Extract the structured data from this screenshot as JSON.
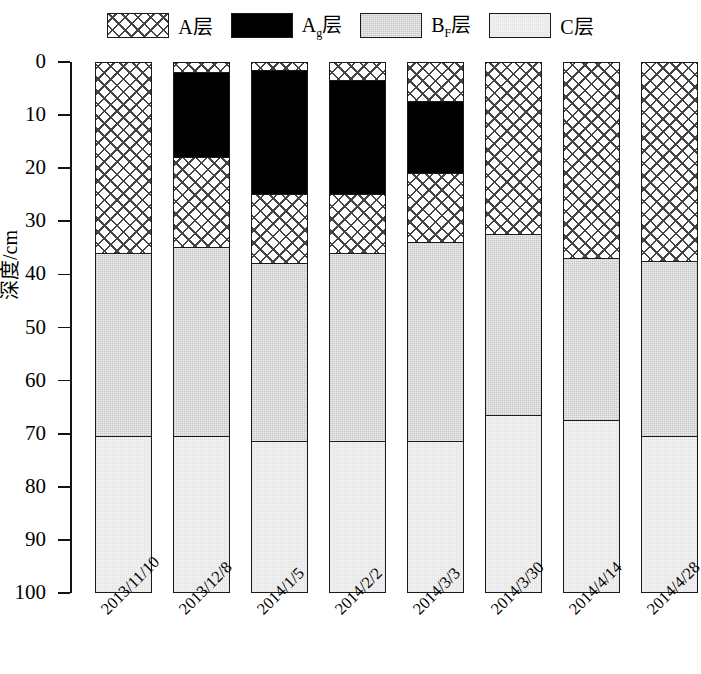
{
  "chart_data": {
    "type": "bar",
    "subtype": "stacked-vertical-soil-profile",
    "title": "",
    "xlabel": "",
    "ylabel": "深度/cm",
    "ylim": [
      0,
      100
    ],
    "y_inverted": true,
    "yticks": [
      0,
      10,
      20,
      30,
      40,
      50,
      60,
      70,
      80,
      90,
      100
    ],
    "ytick_labels": [
      "0",
      "10",
      "20",
      "30",
      "40",
      "50",
      "60",
      "70",
      "80",
      "90",
      "100"
    ],
    "grid": false,
    "legend_position": "top-center",
    "categories": [
      "2013/11/10",
      "2013/12/8",
      "2014/1/5",
      "2014/2/2",
      "2014/3/3",
      "2014/3/30",
      "2014/4/14",
      "2014/4/28"
    ],
    "legend": [
      {
        "key": "A",
        "label": "A层",
        "label_main": "A",
        "label_sub": "",
        "label_tail": "层",
        "fill": "crosshatch",
        "color": "#ffffff"
      },
      {
        "key": "Ag",
        "label": "Ag层",
        "label_main": "A",
        "label_sub": "g",
        "label_tail": "层",
        "fill": "solid",
        "color": "#000000"
      },
      {
        "key": "BF",
        "label": "BF层",
        "label_main": "B",
        "label_sub": "F",
        "label_tail": "层",
        "fill": "stipple",
        "color": "#cfcfcf"
      },
      {
        "key": "C",
        "label": "C层",
        "label_main": "C",
        "label_sub": "",
        "label_tail": "层",
        "fill": "light",
        "color": "#f4f4f4"
      }
    ],
    "columns": [
      {
        "date": "2013/11/10",
        "segments": [
          {
            "layer": "A",
            "top": 0,
            "bottom": 36.0
          },
          {
            "layer": "BF",
            "top": 36.0,
            "bottom": 70.5
          },
          {
            "layer": "C",
            "top": 70.5,
            "bottom": 100
          }
        ]
      },
      {
        "date": "2013/12/8",
        "segments": [
          {
            "layer": "A",
            "top": 0,
            "bottom": 2.0
          },
          {
            "layer": "Ag",
            "top": 2.0,
            "bottom": 18.0
          },
          {
            "layer": "A",
            "top": 18.0,
            "bottom": 35.0
          },
          {
            "layer": "BF",
            "top": 35.0,
            "bottom": 70.5
          },
          {
            "layer": "C",
            "top": 70.5,
            "bottom": 100
          }
        ]
      },
      {
        "date": "2014/1/5",
        "segments": [
          {
            "layer": "A",
            "top": 0,
            "bottom": 1.5
          },
          {
            "layer": "Ag",
            "top": 1.5,
            "bottom": 25.0
          },
          {
            "layer": "A",
            "top": 25.0,
            "bottom": 38.0
          },
          {
            "layer": "BF",
            "top": 38.0,
            "bottom": 71.5
          },
          {
            "layer": "C",
            "top": 71.5,
            "bottom": 100
          }
        ]
      },
      {
        "date": "2014/2/2",
        "segments": [
          {
            "layer": "A",
            "top": 0,
            "bottom": 3.5
          },
          {
            "layer": "Ag",
            "top": 3.5,
            "bottom": 25.0
          },
          {
            "layer": "A",
            "top": 25.0,
            "bottom": 36.0
          },
          {
            "layer": "BF",
            "top": 36.0,
            "bottom": 71.5
          },
          {
            "layer": "C",
            "top": 71.5,
            "bottom": 100
          }
        ]
      },
      {
        "date": "2014/3/3",
        "segments": [
          {
            "layer": "A",
            "top": 0,
            "bottom": 7.5
          },
          {
            "layer": "Ag",
            "top": 7.5,
            "bottom": 21.0
          },
          {
            "layer": "A",
            "top": 21.0,
            "bottom": 34.0
          },
          {
            "layer": "BF",
            "top": 34.0,
            "bottom": 71.5
          },
          {
            "layer": "C",
            "top": 71.5,
            "bottom": 100
          }
        ]
      },
      {
        "date": "2014/3/30",
        "segments": [
          {
            "layer": "A",
            "top": 0,
            "bottom": 32.5
          },
          {
            "layer": "BF",
            "top": 32.5,
            "bottom": 66.5
          },
          {
            "layer": "C",
            "top": 66.5,
            "bottom": 100
          }
        ]
      },
      {
        "date": "2014/4/14",
        "segments": [
          {
            "layer": "A",
            "top": 0,
            "bottom": 37.0
          },
          {
            "layer": "BF",
            "top": 37.0,
            "bottom": 67.5
          },
          {
            "layer": "C",
            "top": 67.5,
            "bottom": 100
          }
        ]
      },
      {
        "date": "2014/4/28",
        "segments": [
          {
            "layer": "A",
            "top": 0,
            "bottom": 37.5
          },
          {
            "layer": "BF",
            "top": 37.5,
            "bottom": 70.5
          },
          {
            "layer": "C",
            "top": 70.5,
            "bottom": 100
          }
        ]
      }
    ]
  }
}
